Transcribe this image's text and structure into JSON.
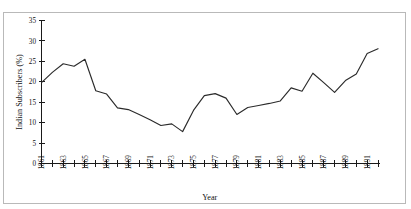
{
  "figure": {
    "background_color": "#ffffff",
    "frame_color": "#b9b9b9",
    "line_color": "#2b2b2b",
    "axis_color": "#1a1a1a"
  },
  "chart_data": {
    "type": "line",
    "title": "",
    "subtitle": "",
    "xlabel": "Year",
    "ylabel": "Indian Subscribers (%)",
    "xlim": [
      1861,
      1892
    ],
    "ylim": [
      0,
      35
    ],
    "grid": false,
    "legend": null,
    "legend_position": "none",
    "ytick_labels": [
      "0",
      "5",
      "10",
      "15",
      "20",
      "25",
      "30",
      "35"
    ],
    "ytick_values": [
      0,
      5,
      10,
      15,
      20,
      25,
      30,
      35
    ],
    "xtick_values": [
      1861,
      1862,
      1863,
      1864,
      1865,
      1866,
      1867,
      1868,
      1869,
      1870,
      1871,
      1872,
      1873,
      1874,
      1875,
      1876,
      1877,
      1878,
      1879,
      1880,
      1881,
      1882,
      1883,
      1884,
      1885,
      1886,
      1887,
      1888,
      1889,
      1890,
      1891,
      1892
    ],
    "xtick_labels": [
      "1861",
      "",
      "1863",
      "",
      "1865",
      "",
      "1867",
      "",
      "1869",
      "",
      "1871",
      "",
      "1873",
      "",
      "1875",
      "",
      "1877",
      "",
      "1879",
      "",
      "1881",
      "",
      "1883",
      "",
      "1885",
      "",
      "1887",
      "",
      "1889",
      "",
      "1891",
      ""
    ],
    "x": [
      1861,
      1862,
      1863,
      1864,
      1865,
      1866,
      1867,
      1868,
      1869,
      1870,
      1871,
      1872,
      1873,
      1874,
      1875,
      1876,
      1877,
      1878,
      1879,
      1880,
      1881,
      1882,
      1883,
      1884,
      1885,
      1886,
      1887,
      1888,
      1889,
      1890,
      1891,
      1892
    ],
    "values": [
      19.8,
      22.3,
      24.4,
      23.8,
      25.5,
      17.8,
      17.0,
      13.6,
      13.2,
      12.0,
      10.7,
      9.3,
      9.7,
      7.8,
      13.0,
      16.6,
      17.1,
      16.0,
      12.0,
      13.7,
      14.2,
      14.7,
      15.3,
      18.5,
      17.7,
      22.1,
      19.8,
      17.4,
      20.3,
      21.9,
      26.9,
      28.1
    ],
    "series": [
      {
        "name": "Indian Subscribers (%)",
        "values": [
          19.8,
          22.3,
          24.4,
          23.8,
          25.5,
          17.8,
          17.0,
          13.6,
          13.2,
          12.0,
          10.7,
          9.3,
          9.7,
          7.8,
          13.0,
          16.6,
          17.1,
          16.0,
          12.0,
          13.7,
          14.2,
          14.7,
          15.3,
          18.5,
          17.7,
          22.1,
          19.8,
          17.4,
          20.3,
          21.9,
          26.9,
          28.1
        ]
      }
    ]
  }
}
